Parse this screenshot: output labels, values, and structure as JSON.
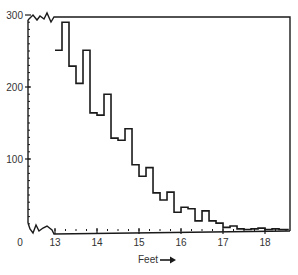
{
  "chart_data": {
    "type": "bar",
    "subtype": "histogram-step",
    "title": "",
    "xlabel": "Feet",
    "xlabel_arrow": "→",
    "ylabel": "",
    "x_ticks": [
      13,
      14,
      15,
      16,
      17,
      18
    ],
    "x_origin_label": "0",
    "y_ticks": [
      100,
      200,
      300
    ],
    "xlim": [
      13,
      18.6
    ],
    "ylim": [
      0,
      300
    ],
    "axis_breaks": {
      "x": true,
      "y": true
    },
    "bin_width": 0.1667,
    "bin_edges_start": 13.0,
    "values": [
      251,
      290,
      229,
      205,
      251,
      164,
      161,
      190,
      129,
      126,
      142,
      92,
      76,
      88,
      53,
      43,
      54,
      26,
      33,
      31,
      14,
      28,
      14,
      11,
      5,
      7,
      3,
      2,
      3,
      4,
      2,
      3,
      2,
      2
    ],
    "grid": false,
    "legend": null,
    "line_color": "#1a1a1a"
  }
}
